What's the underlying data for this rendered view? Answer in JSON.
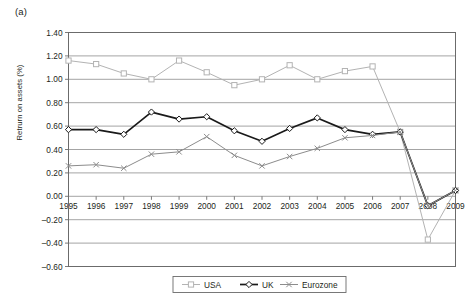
{
  "panel": {
    "label": "(a)"
  },
  "chart_data": {
    "type": "line",
    "title": "",
    "subtitle": "",
    "xlabel": "",
    "ylabel": "Retrurn on assets (%)",
    "categories": [
      "1995",
      "1996",
      "1997",
      "1998",
      "1999",
      "2000",
      "2001",
      "2002",
      "2003",
      "2004",
      "2005",
      "2006",
      "2007",
      "2008",
      "2009"
    ],
    "x": [
      1995,
      1996,
      1997,
      1998,
      1999,
      2000,
      2001,
      2002,
      2003,
      2004,
      2005,
      2006,
      2007,
      2008,
      2009
    ],
    "ylim": [
      -0.6,
      1.4
    ],
    "ytick_values": [
      -0.6,
      -0.4,
      -0.2,
      0.0,
      0.2,
      0.4,
      0.6,
      0.8,
      1.0,
      1.2,
      1.4
    ],
    "ytick_labels": [
      "-0.60",
      "-0.40",
      "-0.20",
      "0.00",
      "0.20",
      "0.40",
      "0.60",
      "0.80",
      "1.00",
      "1.20",
      "1.40"
    ],
    "grid": true,
    "grid_axis": "y",
    "legend_position": "bottom-center",
    "series": [
      {
        "name": "USA",
        "color": "#b3b3b3",
        "marker": "open-square",
        "values": [
          1.16,
          1.13,
          1.05,
          1.0,
          1.16,
          1.06,
          0.95,
          1.0,
          1.12,
          1.0,
          1.07,
          1.11,
          0.55,
          -0.37,
          0.05
        ]
      },
      {
        "name": "UK",
        "color": "#1a1a1a",
        "marker": "filled-diamond",
        "values": [
          0.57,
          0.57,
          0.53,
          0.72,
          0.66,
          0.68,
          0.56,
          0.47,
          0.58,
          0.67,
          0.57,
          0.53,
          0.55,
          -0.08,
          0.05
        ]
      },
      {
        "name": "Eurozone",
        "color": "#8c8c8c",
        "marker": "x-cross",
        "values": [
          0.26,
          0.27,
          0.24,
          0.36,
          0.38,
          0.51,
          0.35,
          0.26,
          0.34,
          0.41,
          0.5,
          0.52,
          0.55,
          -0.08,
          0.05
        ]
      }
    ]
  },
  "legend": {
    "items": [
      {
        "label": "USA"
      },
      {
        "label": "UK"
      },
      {
        "label": "Eurozone"
      }
    ]
  }
}
